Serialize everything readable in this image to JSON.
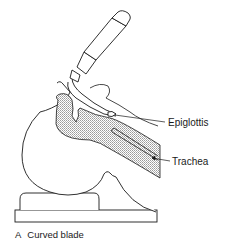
{
  "figure": {
    "labels": {
      "epiglottis": "Epiglottis",
      "trachea": "Trachea"
    },
    "caption": {
      "letter": "A",
      "text": "Curved blade"
    },
    "colors": {
      "line": "#1a1a1a",
      "shade": "#c8c8c8",
      "background": "#ffffff"
    }
  }
}
